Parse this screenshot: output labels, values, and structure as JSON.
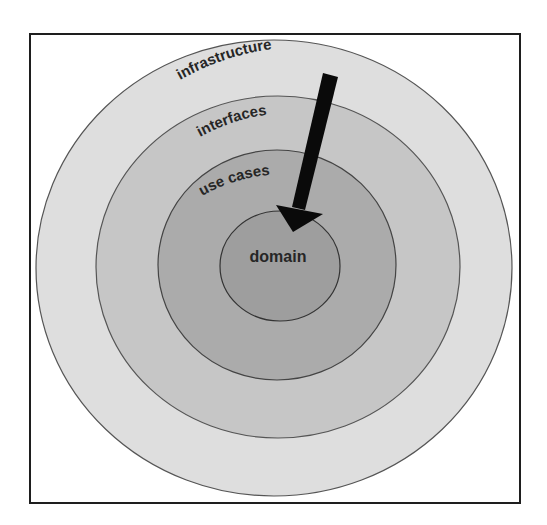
{
  "diagram": {
    "title": "",
    "type": "concentric-layers",
    "layers": [
      {
        "id": "infrastructure",
        "label": "infrastructure",
        "fill": "#dedede",
        "stroke": "#555555"
      },
      {
        "id": "interfaces",
        "label": "interfaces",
        "fill": "#c6c6c6",
        "stroke": "#555555"
      },
      {
        "id": "use-cases",
        "label": "use cases",
        "fill": "#ababab",
        "stroke": "#444444"
      },
      {
        "id": "domain",
        "label": "domain",
        "fill": "#9e9e9e",
        "stroke": "#333333"
      }
    ],
    "arrow": {
      "direction": "inward",
      "from": "infrastructure",
      "to": "domain",
      "color": "#0a0a0a"
    },
    "frame": {
      "border_color": "#1e1e1e",
      "background": "#ffffff"
    }
  }
}
